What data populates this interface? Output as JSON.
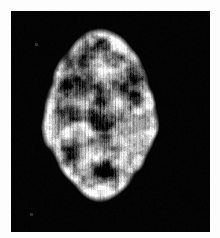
{
  "page": {
    "background_color": "#fdfdfd",
    "width": 220,
    "height": 238
  },
  "scan": {
    "modality_label": "axial-brain-perfusion-scan",
    "panel": {
      "background_color": "#030303",
      "left": 11,
      "top": 11,
      "width": 199,
      "height": 221
    },
    "colormap": "grayscale",
    "intensity_range": [
      0,
      255
    ],
    "texture": "vertical-streak",
    "brain": {
      "orientation": "axial",
      "center_x": 100,
      "center_y": 115,
      "radius_x": 56,
      "radius_y": 85,
      "bounds": {
        "left": 36,
        "top": 15,
        "right": 164,
        "bottom": 211
      }
    },
    "features": [
      {
        "name": "frontal-cortex-rim",
        "intensity": "bright",
        "cx": 100,
        "cy": 35
      },
      {
        "name": "superior-dark-lesion",
        "intensity": "dark",
        "cx": 96,
        "cy": 40
      },
      {
        "name": "left-frontal-dark-patch",
        "intensity": "dark",
        "cx": 62,
        "cy": 60
      },
      {
        "name": "right-frontal-dark-patch",
        "intensity": "dark",
        "cx": 140,
        "cy": 70
      },
      {
        "name": "left-sylvian-dark-band",
        "intensity": "dark",
        "cx": 72,
        "cy": 86
      },
      {
        "name": "right-sylvian-dark-band",
        "intensity": "dark",
        "cx": 128,
        "cy": 84
      },
      {
        "name": "central-ventricle-region",
        "intensity": "dark",
        "cx": 100,
        "cy": 120
      },
      {
        "name": "left-lateral-bright-band",
        "intensity": "bright",
        "cx": 48,
        "cy": 110
      },
      {
        "name": "right-lateral-bright-band",
        "intensity": "bright",
        "cx": 152,
        "cy": 110
      },
      {
        "name": "posterior-dark-lesion",
        "intensity": "dark",
        "cx": 104,
        "cy": 170
      },
      {
        "name": "occipital-bright-rim",
        "intensity": "bright",
        "cx": 100,
        "cy": 195
      }
    ],
    "artifacts": [
      {
        "name": "noise-speck-upper-left",
        "x": 36,
        "y": 44
      },
      {
        "name": "noise-speck-lower-left",
        "x": 31,
        "y": 214
      }
    ]
  }
}
